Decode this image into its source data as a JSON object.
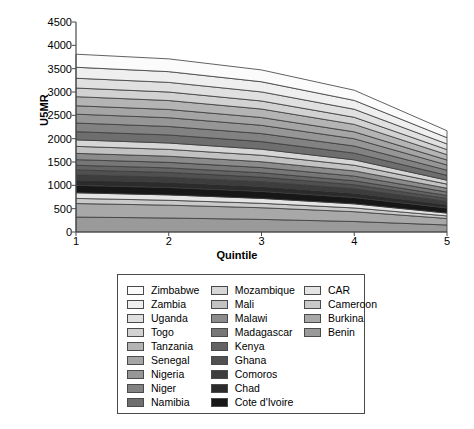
{
  "chart_data": {
    "type": "area",
    "stacked": true,
    "title": "",
    "xlabel": "Quintile",
    "ylabel": "U5MR",
    "x": [
      1,
      2,
      3,
      4,
      5
    ],
    "xtick_labels": [
      "1",
      "2",
      "3",
      "4",
      "5"
    ],
    "ytick_labels": [
      "0",
      "500",
      "1000",
      "1500",
      "2000",
      "2500",
      "3000",
      "3500",
      "4000",
      "4500"
    ],
    "ylim": [
      0,
      4500
    ],
    "xlim": [
      1,
      5
    ],
    "ytick_step": 500,
    "grid": false,
    "legend_position": "below-plot",
    "legend_columns": 3,
    "totals": [
      4210,
      4160,
      3800,
      3380,
      2430
    ],
    "series": [
      {
        "name": "Benin",
        "color": "#9a9a9a",
        "values": [
          320,
          300,
          270,
          225,
          150
        ]
      },
      {
        "name": "Burkina",
        "color": "#a8a8a8",
        "values": [
          290,
          275,
          250,
          210,
          140
        ]
      },
      {
        "name": "Cameroon",
        "color": "#c9c9c9",
        "values": [
          110,
          105,
          95,
          80,
          55
        ]
      },
      {
        "name": "CAR",
        "color": "#e4e4e4",
        "values": [
          120,
          115,
          105,
          88,
          60
        ]
      },
      {
        "name": "Cote d'Ivoire",
        "color": "#171717",
        "values": [
          160,
          158,
          150,
          135,
          110
        ]
      },
      {
        "name": "Chad",
        "color": "#2b2b2b",
        "values": [
          115,
          112,
          106,
          95,
          72
        ]
      },
      {
        "name": "Comoros",
        "color": "#3d3d3d",
        "values": [
          110,
          108,
          102,
          92,
          68
        ]
      },
      {
        "name": "Ghana",
        "color": "#505050",
        "values": [
          105,
          103,
          98,
          88,
          65
        ]
      },
      {
        "name": "Kenya",
        "color": "#636363",
        "values": [
          100,
          98,
          93,
          84,
          62
        ]
      },
      {
        "name": "Madagascar",
        "color": "#777777",
        "values": [
          120,
          118,
          112,
          100,
          74
        ]
      },
      {
        "name": "Malawi",
        "color": "#8b8b8b",
        "values": [
          135,
          132,
          125,
          112,
          82
        ]
      },
      {
        "name": "Mali",
        "color": "#c2c2c2",
        "values": [
          150,
          146,
          138,
          122,
          88
        ]
      },
      {
        "name": "Mozambique",
        "color": "#d6d6d6",
        "values": [
          140,
          137,
          130,
          115,
          84
        ]
      },
      {
        "name": "Namibia",
        "color": "#6e6e6e",
        "values": [
          175,
          172,
          163,
          144,
          104
        ]
      },
      {
        "name": "Niger",
        "color": "#828282",
        "values": [
          185,
          182,
          172,
          152,
          110
        ]
      },
      {
        "name": "Nigeria",
        "color": "#969696",
        "values": [
          190,
          187,
          177,
          156,
          112
        ]
      },
      {
        "name": "Senegal",
        "color": "#a5a5a5",
        "values": [
          180,
          177,
          167,
          148,
          106
        ]
      },
      {
        "name": "Tanzania",
        "color": "#b4b4b4",
        "values": [
          195,
          192,
          182,
          160,
          115
        ]
      },
      {
        "name": "Togo",
        "color": "#d2d2d2",
        "values": [
          185,
          182,
          172,
          152,
          108
        ]
      },
      {
        "name": "Uganda",
        "color": "#e0e0e0",
        "values": [
          210,
          207,
          195,
          172,
          122
        ]
      },
      {
        "name": "Zambia",
        "color": "#efefef",
        "values": [
          235,
          230,
          217,
          190,
          134
        ]
      },
      {
        "name": "Zimbabwe",
        "color": "#fbfbfb",
        "values": [
          280,
          274,
          254,
          218,
          149
        ]
      }
    ]
  },
  "axes": {
    "ylabel": "U5MR",
    "xlabel": "Quintile",
    "yticks": [
      "4500",
      "4000",
      "3500",
      "3000",
      "2500",
      "2000",
      "1500",
      "1000",
      "500",
      "0"
    ],
    "xticks": [
      "1",
      "2",
      "3",
      "4",
      "5"
    ]
  },
  "legend": {
    "columns": [
      {
        "items": [
          {
            "label": "Zimbabwe",
            "color": "#fbfbfb"
          },
          {
            "label": "Zambia",
            "color": "#efefef"
          },
          {
            "label": "Uganda",
            "color": "#e0e0e0"
          },
          {
            "label": "Togo",
            "color": "#d2d2d2"
          },
          {
            "label": "Tanzania",
            "color": "#b4b4b4"
          },
          {
            "label": "Senegal",
            "color": "#a5a5a5"
          },
          {
            "label": "Nigeria",
            "color": "#969696"
          },
          {
            "label": "Niger",
            "color": "#828282"
          },
          {
            "label": "Namibia",
            "color": "#6e6e6e"
          }
        ]
      },
      {
        "items": [
          {
            "label": "Mozambique",
            "color": "#d6d6d6"
          },
          {
            "label": "Mali",
            "color": "#c2c2c2"
          },
          {
            "label": "Malawi",
            "color": "#8b8b8b"
          },
          {
            "label": "Madagascar",
            "color": "#777777"
          },
          {
            "label": "Kenya",
            "color": "#636363"
          },
          {
            "label": "Ghana",
            "color": "#505050"
          },
          {
            "label": "Comoros",
            "color": "#3d3d3d"
          },
          {
            "label": "Chad",
            "color": "#2b2b2b"
          },
          {
            "label": "Cote d'Ivoire",
            "color": "#171717"
          }
        ]
      },
      {
        "items": [
          {
            "label": "CAR",
            "color": "#e4e4e4"
          },
          {
            "label": "Cameroon",
            "color": "#c9c9c9"
          },
          {
            "label": "Burkina",
            "color": "#a8a8a8"
          },
          {
            "label": "Benin",
            "color": "#9a9a9a"
          }
        ]
      }
    ]
  },
  "style": {
    "axis_color": "#4a4a4a",
    "band_stroke": "#3a3a3a",
    "background": "#ffffff"
  }
}
